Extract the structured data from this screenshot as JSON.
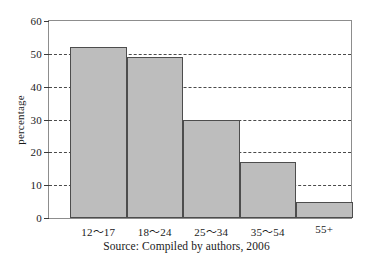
{
  "chart_data": {
    "type": "bar",
    "title": "",
    "subtitle": "",
    "xlabel": "",
    "ylabel": "percentage",
    "categories": [
      "12～17",
      "18～24",
      "25～34",
      "35～54",
      "55+"
    ],
    "values": [
      52,
      49,
      30,
      17,
      5
    ],
    "ylim": [
      0,
      60
    ],
    "yticks": [
      0,
      10,
      20,
      30,
      40,
      50,
      60
    ],
    "ytick_labels": [
      "0",
      "10",
      "20",
      "30",
      "40",
      "50",
      "60"
    ],
    "gridlines_at": [
      10,
      20,
      30,
      40,
      50
    ],
    "grid": "horizontal-dashed",
    "legend": "none",
    "bar_fill_color": "#bdbdbd",
    "bar_border_color": "#4d4d4d",
    "grid_color": "#4a4a4a",
    "frame_color": "#8d8d8d",
    "background_color": "#ffffff",
    "annotations": []
  },
  "caption": {
    "text": "Source: Compiled by authors, 2006"
  }
}
